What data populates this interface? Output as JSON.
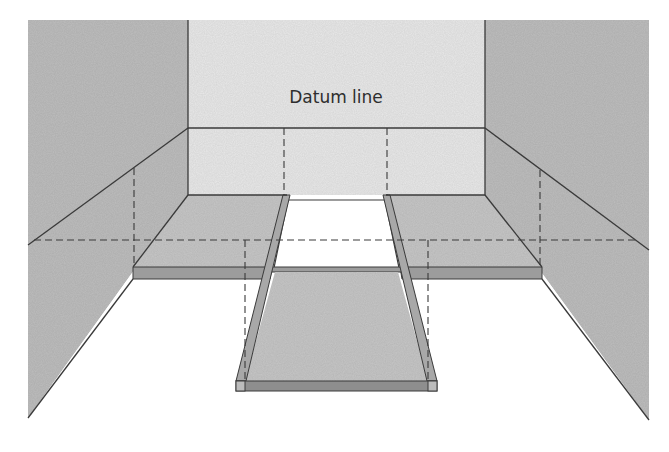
{
  "diagram": {
    "type": "perspective-illustration",
    "labels": {
      "datum": "Datum line"
    },
    "colors": {
      "background": "#ffffff",
      "side_wall": "#bdbdbd",
      "back_wall": "#e6e6e6",
      "platform_top": "#c4c4c4",
      "platform_edge": "#9a9a9a",
      "line": "#3a3a3a"
    }
  }
}
